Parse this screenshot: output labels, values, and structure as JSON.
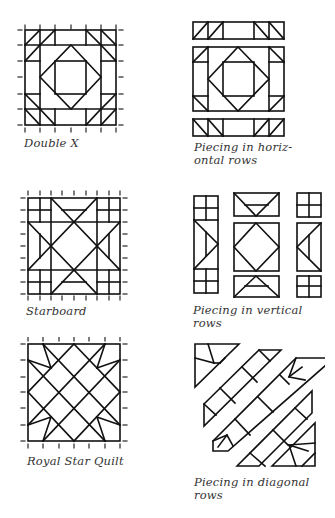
{
  "figures": [
    {
      "id": "double-x",
      "caption": "Double X"
    },
    {
      "id": "horizontal-rows",
      "caption_line1": "Piecing in horiz-",
      "caption_line2": "ontal rows"
    },
    {
      "id": "starboard",
      "caption": "Starboard"
    },
    {
      "id": "vertical-rows",
      "caption": "Piecing in vertical rows"
    },
    {
      "id": "royal-star-quilt",
      "caption": "Royal Star Quilt"
    },
    {
      "id": "diagonal-rows",
      "caption_line1": "Piecing in diagonal",
      "caption_line2": "rows"
    }
  ],
  "colors": {
    "ink": "#111111",
    "caption": "#333333",
    "background": "#ffffff"
  }
}
